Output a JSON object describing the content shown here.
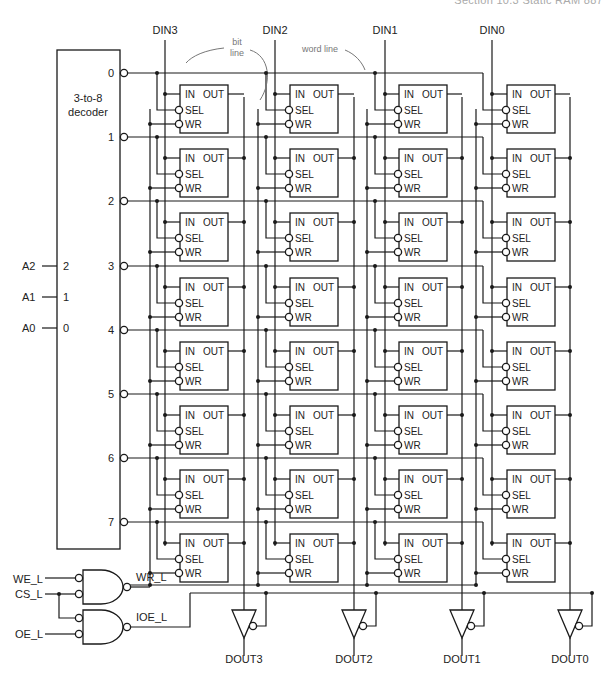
{
  "header": {
    "running_head": "Section 10.3    Static RAM    887"
  },
  "decoder": {
    "label_line1": "3-to-8",
    "label_line2": "decoder",
    "inputs": [
      {
        "signal": "A2",
        "pin": "2"
      },
      {
        "signal": "A1",
        "pin": "1"
      },
      {
        "signal": "A0",
        "pin": "0"
      }
    ],
    "outputs": [
      "0",
      "1",
      "2",
      "3",
      "4",
      "5",
      "6",
      "7"
    ]
  },
  "columns": [
    {
      "din": "DIN3",
      "dout": "DOUT3"
    },
    {
      "din": "DIN2",
      "dout": "DOUT2"
    },
    {
      "din": "DIN1",
      "dout": "DOUT1"
    },
    {
      "din": "DIN0",
      "dout": "DOUT0"
    }
  ],
  "cell": {
    "in": "IN",
    "out": "OUT",
    "sel": "SEL",
    "wr": "WR"
  },
  "annotations": {
    "bit_line_1": "bit",
    "bit_line_2": "line",
    "word_line": "word line"
  },
  "control": {
    "inputs": [
      "WE_L",
      "CS_L",
      "OE_L"
    ],
    "wr_signal": "WR_L",
    "ioe_signal": "IOE_L"
  },
  "colors": {
    "line": "#1a1a1a",
    "annotation": "#777777",
    "background": "#ffffff"
  }
}
